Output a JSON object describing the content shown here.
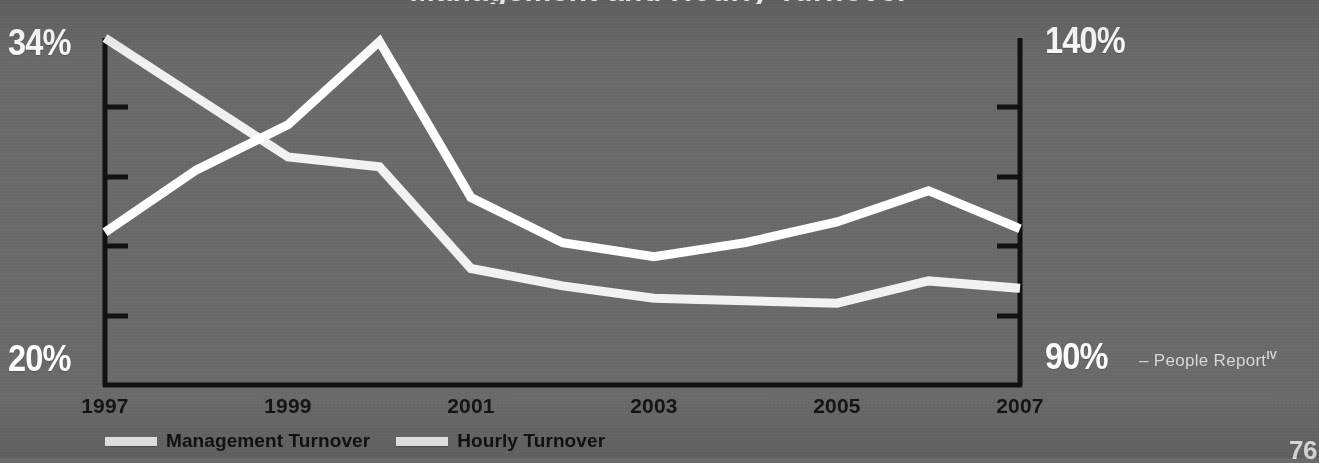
{
  "page": {
    "background_color": "#6a6a6a",
    "page_number": "76"
  },
  "title_sliver": "Management and Hourly Turnover",
  "axes": {
    "left": {
      "top_label": "34%",
      "bottom_label": "20%",
      "min": 20,
      "max": 34,
      "tick_count": 4,
      "color": "#ffffff"
    },
    "right": {
      "top_label": "140%",
      "bottom_label": "90%",
      "min": 90,
      "max": 140,
      "tick_count": 4,
      "color": "#ffffff"
    },
    "axis_line_color": "#111111"
  },
  "xaxis": {
    "labels": [
      "1997",
      "1999",
      "2001",
      "2003",
      "2005",
      "2007"
    ],
    "label_color": "#141414"
  },
  "legend": {
    "items": [
      {
        "label": "Management Turnover",
        "swatch_color": "#efefef"
      },
      {
        "label": "Hourly Turnover",
        "swatch_color": "#efefef"
      }
    ]
  },
  "attribution": {
    "dash": "–",
    "text": "People Report",
    "superscript": "IV"
  },
  "chart_data": {
    "type": "line",
    "title": "Management and Hourly Turnover",
    "xlabel": "",
    "ylabel": "",
    "grid": false,
    "legend_position": "bottom-left",
    "x": [
      1997,
      1998,
      1999,
      2000,
      2001,
      2002,
      2003,
      2004,
      2005,
      2006,
      2007
    ],
    "xtick_labels": [
      "1997",
      "1999",
      "2001",
      "2003",
      "2005",
      "2007"
    ],
    "xtick_values": [
      1997,
      1999,
      2001,
      2003,
      2005,
      2007
    ],
    "series": [
      {
        "name": "Management Turnover",
        "axis": "left",
        "ylabel": "Management Turnover (%)",
        "ylim": [
          20,
          34
        ],
        "ytick_labels": [
          "20%",
          "34%"
        ],
        "color": "#f2f2f2",
        "values": [
          34.0,
          31.6,
          29.2,
          28.8,
          24.7,
          24.0,
          23.5,
          23.4,
          23.3,
          24.2,
          23.9
        ]
      },
      {
        "name": "Hourly Turnover",
        "axis": "right",
        "ylabel": "Hourly Turnover (%)",
        "ylim": [
          90,
          140
        ],
        "ytick_labels": [
          "90%",
          "140%"
        ],
        "color": "#ffffff",
        "values": [
          112.0,
          121.0,
          127.5,
          139.5,
          117.0,
          110.5,
          108.5,
          110.5,
          113.5,
          118.0,
          112.5
        ]
      }
    ]
  },
  "plot_geometry": {
    "left": 105,
    "right": 1020,
    "top": 38,
    "bottom": 385
  }
}
